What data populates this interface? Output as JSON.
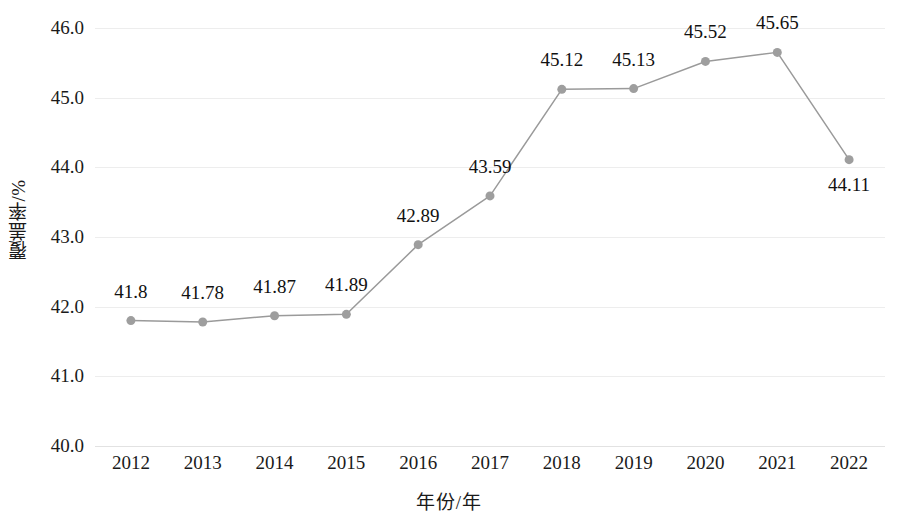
{
  "chart_data": {
    "type": "line",
    "title": "",
    "xlabel": "年份/年",
    "ylabel": "覆盖率/%",
    "categories": [
      "2012",
      "2013",
      "2014",
      "2015",
      "2016",
      "2017",
      "2018",
      "2019",
      "2020",
      "2021",
      "2022"
    ],
    "values": [
      41.8,
      41.78,
      41.87,
      41.89,
      42.89,
      43.59,
      45.12,
      45.13,
      45.52,
      45.65,
      44.11
    ],
    "point_labels": [
      "41.8",
      "41.78",
      "41.87",
      "41.89",
      "42.89",
      "43.59",
      "45.12",
      "45.13",
      "45.52",
      "45.65",
      "44.11"
    ],
    "point_label_position": [
      "above",
      "above",
      "above",
      "above",
      "above",
      "above",
      "above",
      "above",
      "above",
      "above",
      "below"
    ],
    "ylim": [
      40.0,
      46.0
    ],
    "ytick_values": [
      46.0,
      45.0,
      44.0,
      43.0,
      42.0,
      41.0,
      40.0
    ],
    "ytick_labels": [
      "46.0",
      "45.0",
      "44.0",
      "43.0",
      "42.0",
      "41.0",
      "40.0"
    ],
    "grid": "horizontal",
    "legend": "none",
    "series_color": "#9a9a9a",
    "marker_color": "#9e9e9e",
    "gridline_color": "#ededed",
    "marker": "circle",
    "marker_size": 9,
    "line_width": 1.5
  }
}
